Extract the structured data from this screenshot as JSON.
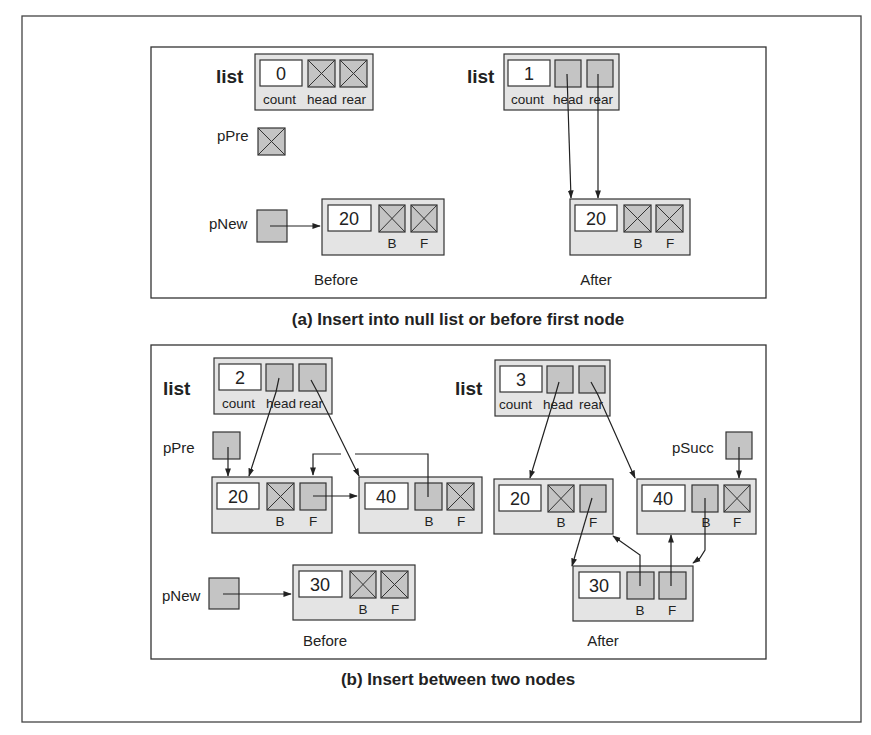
{
  "colors": {
    "record_fill": "#e4e4e4",
    "pointer_fill": "#c4c4c4",
    "value_fill": "#ffffff",
    "stroke": "#333333"
  },
  "panel_a": {
    "caption": "(a) Insert into null list or before first node",
    "before": {
      "label": "Before",
      "list_label": "list",
      "list": {
        "count": "0",
        "head": "null",
        "rear": "null"
      },
      "field_labels": [
        "count",
        "head",
        "rear"
      ],
      "pPre": {
        "label": "pPre",
        "value": "null"
      },
      "pNew": {
        "label": "pNew",
        "points_to": "node-20"
      },
      "node": {
        "data": "20",
        "B": "null",
        "F": "null",
        "B_label": "B",
        "F_label": "F"
      }
    },
    "after": {
      "label": "After",
      "list_label": "list",
      "list": {
        "count": "1",
        "head": "node-20",
        "rear": "node-20"
      },
      "field_labels": [
        "count",
        "head",
        "rear"
      ],
      "node": {
        "data": "20",
        "B": "null",
        "F": "null",
        "B_label": "B",
        "F_label": "F"
      }
    }
  },
  "panel_b": {
    "caption": "(b) Insert between two nodes",
    "before": {
      "label": "Before",
      "list_label": "list",
      "list": {
        "count": "2",
        "head": "node-20",
        "rear": "node-40"
      },
      "field_labels": [
        "count",
        "head",
        "rear"
      ],
      "pPre": {
        "label": "pPre",
        "points_to": "node-20"
      },
      "pNew": {
        "label": "pNew",
        "points_to": "node-30"
      },
      "nodes": [
        {
          "data": "20",
          "B": "null",
          "F": "node-40",
          "B_label": "B",
          "F_label": "F"
        },
        {
          "data": "40",
          "B": "node-20",
          "F": "null",
          "B_label": "B",
          "F_label": "F"
        },
        {
          "data": "30",
          "B": "null",
          "F": "null",
          "B_label": "B",
          "F_label": "F"
        }
      ]
    },
    "after": {
      "label": "After",
      "list_label": "list",
      "list": {
        "count": "3",
        "head": "node-20",
        "rear": "node-40"
      },
      "field_labels": [
        "count",
        "head",
        "rear"
      ],
      "pSucc": {
        "label": "pSucc",
        "points_to": "node-40"
      },
      "nodes": [
        {
          "data": "20",
          "B": "null",
          "F": "node-30",
          "B_label": "B",
          "F_label": "F"
        },
        {
          "data": "40",
          "B": "node-30",
          "F": "null",
          "B_label": "B",
          "F_label": "F"
        },
        {
          "data": "30",
          "B": "node-20",
          "F": "node-40",
          "B_label": "B",
          "F_label": "F"
        }
      ]
    }
  }
}
